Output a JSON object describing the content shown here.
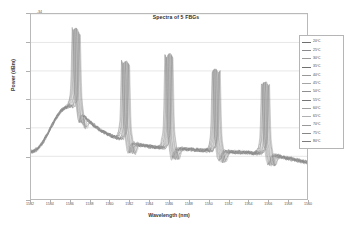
{
  "chart_data": {
    "type": "line",
    "title": "Spectra of 5 FBGs",
    "xlabel": "Wavelength (nm)",
    "ylabel": "Power (dBm)",
    "xlim": [
      1532,
      1560
    ],
    "ylim": [
      -60,
      -34
    ],
    "grid": true,
    "legend_position": "right",
    "xticks": [
      1532,
      1534,
      1536,
      1538,
      1540,
      1542,
      1544,
      1546,
      1548,
      1550,
      1552,
      1554,
      1556,
      1558,
      1560
    ],
    "yticks": [
      -34,
      -38,
      -42,
      -46,
      -50,
      -54,
      -60
    ],
    "ytick_labels": [
      "-34",
      "-38",
      "-42",
      "-46",
      "-50",
      "-54",
      "-60"
    ],
    "peaks_nm": [
      1536.2,
      1541.2,
      1545.6,
      1550.4,
      1555.4
    ],
    "peak_power_dbm": [
      -44.5,
      -44.6,
      -43.0,
      -44.4,
      -45.5
    ],
    "baseline_power_dbm": -52.5,
    "series": [
      {
        "name": "20ºC",
        "color": "#6e6e6e",
        "offset_nm": 0.0
      },
      {
        "name": "25ºC",
        "color": "#8a8a8a",
        "offset_nm": 0.06
      },
      {
        "name": "30ºC",
        "color": "#9a9a9a",
        "offset_nm": 0.12
      },
      {
        "name": "35ºC",
        "color": "#707070",
        "offset_nm": 0.18
      },
      {
        "name": "40ºC",
        "color": "#989898",
        "offset_nm": 0.24
      },
      {
        "name": "45ºC",
        "color": "#a5a5a5",
        "offset_nm": 0.3
      },
      {
        "name": "50ºC",
        "color": "#8f8f8f",
        "offset_nm": 0.36
      },
      {
        "name": "55ºC",
        "color": "#757575",
        "offset_nm": 0.42
      },
      {
        "name": "60ºC",
        "color": "#a0a0a0",
        "offset_nm": 0.48
      },
      {
        "name": "65ºC",
        "color": "#b0b0b0",
        "offset_nm": 0.54
      },
      {
        "name": "70ºC",
        "color": "#999999",
        "offset_nm": 0.6
      },
      {
        "name": "75ºC",
        "color": "#878787",
        "offset_nm": 0.66
      },
      {
        "name": "80ºC",
        "color": "#7c7c7c",
        "offset_nm": 0.72
      },
      {
        "name": "85ºC",
        "color": "#949494",
        "offset_nm": 0.78
      }
    ]
  },
  "legend": {
    "items": [
      {
        "label": "20ºC"
      },
      {
        "label": "25ºC"
      },
      {
        "label": "30ºC"
      },
      {
        "label": "35ºC"
      },
      {
        "label": "40ºC"
      },
      {
        "label": "45ºC"
      },
      {
        "label": "50ºC"
      },
      {
        "label": "55ºC"
      },
      {
        "label": "60ºC"
      },
      {
        "label": "65ºC"
      },
      {
        "label": "70ºC"
      },
      {
        "label": "75ºC"
      },
      {
        "label": "80ºC"
      }
    ]
  },
  "colors": {
    "frame": "#b9b9b9",
    "grid": "#cfcfcf",
    "text": "#555555",
    "trace": "#8a8a8a"
  }
}
